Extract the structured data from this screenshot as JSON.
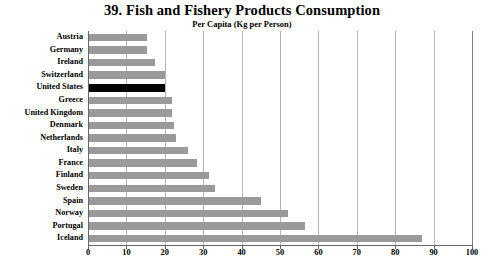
{
  "chart_data": {
    "type": "bar",
    "orientation": "horizontal",
    "title": "39. Fish and Fishery Products Consumption",
    "subtitle": "Per Capita (Kg per Person)",
    "xlabel": "",
    "ylabel": "",
    "xlim": [
      0,
      100
    ],
    "xticks": [
      0,
      10,
      20,
      30,
      40,
      50,
      60,
      70,
      80,
      90,
      100
    ],
    "grid": "vertical",
    "legend": "none",
    "highlight_category": "United States",
    "colors": {
      "bar": "#9a9a9a",
      "highlight_bar": "#000000",
      "gridline": "#b4b4b4",
      "axis": "#666666",
      "background": "#ffffff",
      "text": "#000000"
    },
    "categories": [
      "Austria",
      "Germany",
      "Ireland",
      "Switzerland",
      "United States",
      "Greece",
      "United Kingdom",
      "Denmark",
      "Netherlands",
      "Italy",
      "France",
      "Finland",
      "Sweden",
      "Spain",
      "Norway",
      "Portugal",
      "Iceland"
    ],
    "values": [
      15.4,
      15.4,
      17.5,
      20,
      20,
      22,
      22,
      22.5,
      23,
      26,
      28.5,
      31.5,
      33,
      45,
      52,
      56.5,
      87
    ]
  }
}
